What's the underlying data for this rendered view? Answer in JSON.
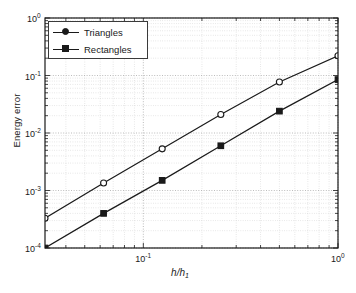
{
  "figure": {
    "background_color": "#ffffff",
    "axis_color": "#1a1a1a",
    "grid_color": "#b4b4b4"
  },
  "axis": {
    "ylabel": "Energy error",
    "xlabel_numerator": "h",
    "xlabel_slash": "/",
    "xlabel_denominator": "h",
    "xlabel_subscript": "1",
    "y_ticklabels": [
      {
        "mantissa": "10",
        "exponent": "0"
      },
      {
        "mantissa": "10",
        "exponent": "-1"
      },
      {
        "mantissa": "10",
        "exponent": "-2"
      },
      {
        "mantissa": "10",
        "exponent": "-3"
      },
      {
        "mantissa": "10",
        "exponent": "-4"
      }
    ],
    "x_ticklabels": [
      {
        "mantissa": "10",
        "exponent": "-1"
      },
      {
        "mantissa": "10",
        "exponent": "0"
      }
    ]
  },
  "legend": {
    "position": "top-left",
    "entries": [
      {
        "label": "Triangles",
        "marker": "circle",
        "color": "#1a1a1a"
      },
      {
        "label": "Rectangles",
        "marker": "square",
        "color": "#1a1a1a"
      }
    ]
  },
  "chart_data": {
    "type": "line",
    "title": "",
    "subtitle": "",
    "xlabel": "h/h_1",
    "ylabel": "Energy error",
    "xscale": "log",
    "yscale": "log",
    "xlim": [
      0.03125,
      1.0
    ],
    "ylim": [
      0.0001,
      1.0
    ],
    "grid": true,
    "grid_minor": true,
    "legend_position": "upper left",
    "x": [
      0.03125,
      0.0625,
      0.125,
      0.25,
      0.5,
      1.0
    ],
    "series": [
      {
        "name": "Triangles",
        "marker": "circle",
        "color": "#1a1a1a",
        "values": [
          0.00033,
          0.00135,
          0.0053,
          0.021,
          0.077,
          0.22
        ]
      },
      {
        "name": "Rectangles",
        "marker": "square",
        "color": "#1a1a1a",
        "values": [
          0.0001,
          0.0004,
          0.0015,
          0.006,
          0.024,
          0.085
        ]
      }
    ]
  }
}
